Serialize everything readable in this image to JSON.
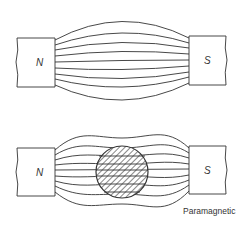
{
  "diagrams": [
    {
      "id": "top",
      "north_label": "N",
      "south_label": "S",
      "description": "Uniform field between magnet poles"
    },
    {
      "id": "bottom",
      "north_label": "N",
      "south_label": "S",
      "caption": "Paramagnetic"
    }
  ],
  "colors": {
    "line": "#333333",
    "background": "#ffffff"
  }
}
